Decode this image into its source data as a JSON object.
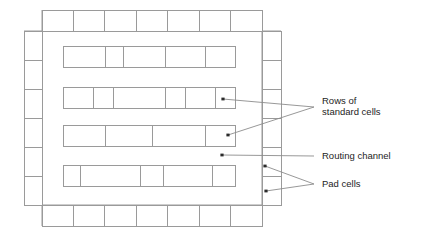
{
  "diagram": {
    "colors": {
      "outline": "#9a9a9a",
      "leader": "#8c8c8c",
      "text": "#1d1d1d",
      "background": "#ffffff",
      "dot": "#2b2b2b"
    },
    "die": {
      "name": "die-outline",
      "left": 42,
      "right": 262,
      "top": 31,
      "bottom": 205,
      "outer_left": 24,
      "outer_right": 281,
      "outer_top": 10,
      "outer_bottom": 226
    },
    "pad_rows": {
      "top": {
        "name": "pad-row-top",
        "count": 7,
        "x": 42,
        "y": 10,
        "width": 220,
        "height": 21,
        "dividers": [
          73,
          104,
          136,
          167,
          199,
          230
        ]
      },
      "bottom": {
        "name": "pad-row-bottom",
        "count": 7,
        "x": 42,
        "y": 205,
        "width": 220,
        "height": 21,
        "dividers": [
          73,
          104,
          136,
          167,
          199,
          230
        ]
      },
      "left": {
        "name": "pad-column-left",
        "count": 6,
        "x": 24,
        "y": 31,
        "width": 18,
        "height": 174,
        "dividers": [
          60,
          89,
          118,
          147,
          176
        ]
      },
      "right": {
        "name": "pad-column-right",
        "count": 6,
        "x": 262,
        "y": 31,
        "width": 19,
        "height": 174,
        "dividers": [
          60,
          89,
          118,
          147,
          176
        ]
      }
    },
    "cell_rows": [
      {
        "name": "standard-cell-row-1",
        "x": 63,
        "y": 46,
        "width": 172,
        "height": 21,
        "cell_count": 5,
        "dividers": [
          105,
          123,
          165,
          205
        ]
      },
      {
        "name": "standard-cell-row-2",
        "x": 63,
        "y": 87,
        "width": 172,
        "height": 21,
        "cell_count": 6,
        "dividers": [
          93,
          113,
          165,
          185,
          215
        ]
      },
      {
        "name": "standard-cell-row-3",
        "x": 63,
        "y": 125,
        "width": 172,
        "height": 21,
        "cell_count": 4,
        "dividers": [
          105,
          152,
          205
        ]
      },
      {
        "name": "standard-cell-row-4",
        "x": 63,
        "y": 165,
        "width": 172,
        "height": 21,
        "cell_count": 5,
        "dividers": [
          80,
          140,
          163,
          212
        ]
      }
    ],
    "annotations": [
      {
        "name": "annotation-rows-of-standard-cells",
        "lines": [
          "Rows of",
          "standard cells"
        ],
        "text_x": 322,
        "text_y": 101,
        "line_height": 11,
        "apex_x": 314,
        "apex_y": 107,
        "targets": [
          {
            "x": 223,
            "y": 99
          },
          {
            "x": 228,
            "y": 135
          }
        ]
      },
      {
        "name": "annotation-routing-channel",
        "lines": [
          "Routing channel"
        ],
        "text_x": 322,
        "text_y": 156,
        "line_height": 11,
        "apex_x": 314,
        "apex_y": 156,
        "targets": [
          {
            "x": 222,
            "y": 155
          }
        ]
      },
      {
        "name": "annotation-pad-cells",
        "lines": [
          "Pad cells"
        ],
        "text_x": 322,
        "text_y": 184,
        "line_height": 11,
        "apex_x": 314,
        "apex_y": 184,
        "targets": [
          {
            "x": 265,
            "y": 166
          },
          {
            "x": 266,
            "y": 191
          }
        ]
      }
    ]
  }
}
